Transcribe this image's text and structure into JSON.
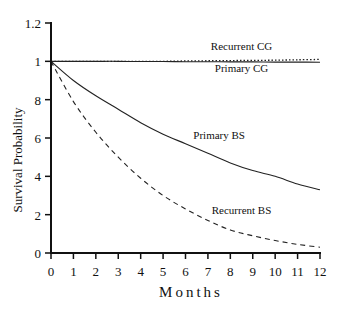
{
  "chart_data": {
    "type": "line",
    "title": "",
    "xlabel": "Months",
    "ylabel": "Survival Probability",
    "xlim": [
      0,
      12
    ],
    "ylim": [
      0,
      1.2
    ],
    "grid": false,
    "legend": "inline labels",
    "x_ticks": [
      "0",
      "1",
      "2",
      "3",
      "4",
      "5",
      "6",
      "7",
      "8",
      "9",
      "10",
      "11",
      "12"
    ],
    "y_ticks": [
      {
        "value": 0,
        "label": "0"
      },
      {
        "value": 0.2,
        "label": "2"
      },
      {
        "value": 0.4,
        "label": "4"
      },
      {
        "value": 0.6,
        "label": "6"
      },
      {
        "value": 0.8,
        "label": "8"
      },
      {
        "value": 1.0,
        "label": "1"
      },
      {
        "value": 1.2,
        "label": "1.2"
      }
    ],
    "x": [
      0,
      1,
      2,
      3,
      4,
      5,
      6,
      7,
      8,
      9,
      10,
      11,
      12
    ],
    "series": [
      {
        "name": "Recurrent CG",
        "style": "dotted",
        "values": [
          1.0,
          1.0,
          1.0,
          1.0,
          1.0,
          1.0,
          1.002,
          1.003,
          1.004,
          1.005,
          1.006,
          1.008,
          1.01
        ],
        "label_pos": {
          "x": 8.5,
          "y": 1.06
        }
      },
      {
        "name": "Primary CG",
        "style": "solid",
        "values": [
          1.0,
          1.0,
          1.0,
          1.0,
          0.999,
          0.999,
          0.998,
          0.998,
          0.997,
          0.997,
          0.996,
          0.996,
          0.995
        ],
        "label_pos": {
          "x": 8.5,
          "y": 0.945
        }
      },
      {
        "name": "Primary BS",
        "style": "solid",
        "values": [
          1.0,
          0.9,
          0.82,
          0.75,
          0.68,
          0.62,
          0.57,
          0.52,
          0.47,
          0.43,
          0.4,
          0.36,
          0.33
        ],
        "label_pos": {
          "x": 7.5,
          "y": 0.595
        }
      },
      {
        "name": "Recurrent BS",
        "style": "dashed",
        "values": [
          1.0,
          0.79,
          0.63,
          0.5,
          0.39,
          0.3,
          0.23,
          0.17,
          0.12,
          0.09,
          0.065,
          0.045,
          0.03
        ],
        "label_pos": {
          "x": 8.5,
          "y": 0.205
        }
      }
    ]
  }
}
